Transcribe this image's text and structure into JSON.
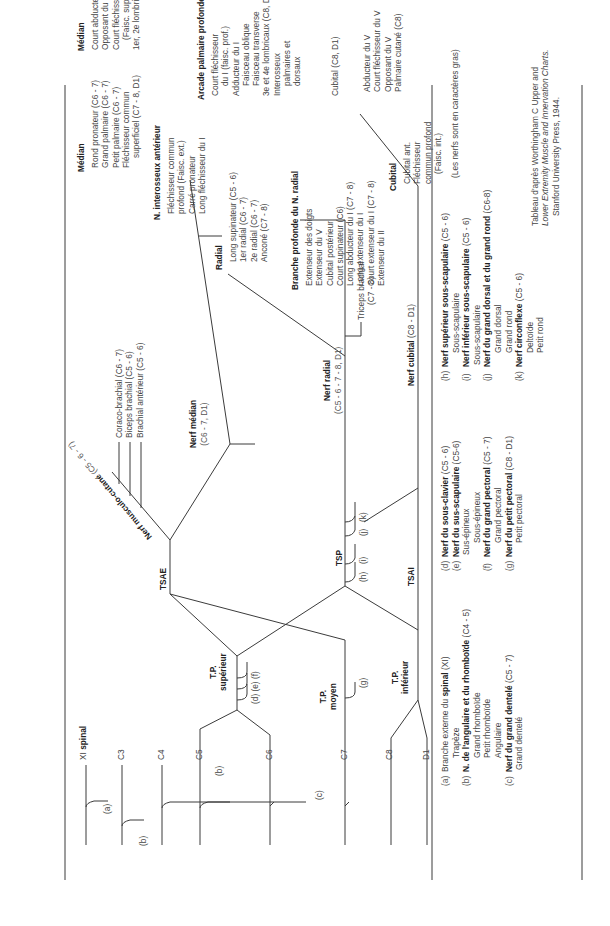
{
  "title": [
    "NERF CRANIEN ET",
    "BRANCHES ANTÉRIEURES DES",
    "NERFS RACHIDIENS"
  ],
  "columns": {
    "racines": "Racines",
    "troncs_primaires": "Troncs primaires",
    "troncs_secondaires": "Troncs secondaires",
    "branches_terminales": "Branches terminales",
    "bras": "Bras",
    "avant_bras": "Avant-bras",
    "main": "Main"
  },
  "roots": {
    "xi": "XI",
    "xi_name": "spinal",
    "c3": "C3",
    "c4": "C4",
    "c5": "C5",
    "c6": "C6",
    "c7": "C7",
    "c8": "C8",
    "d1": "D1"
  },
  "root_labels": {
    "a": "(a)",
    "b1": "(b)",
    "b2": "(b)",
    "c": "(c)"
  },
  "trunks": {
    "sup_1": "T.P.",
    "sup_2": "supérieur",
    "moy_1": "T.P.",
    "moy_2": "moyen",
    "inf_1": "T.P.",
    "inf_2": "inférieur",
    "sup_labels": "(d)  (e)  (f)",
    "moy_label": "(g)"
  },
  "secondary": {
    "tsae": "TSAE",
    "tsp": "TSP",
    "tsai": "TSAI",
    "tsp_labels": {
      "h": "(h)",
      "i": "(i)",
      "j": "(j)",
      "k": "(k)"
    }
  },
  "terminal": {
    "musculo": "Nerf musculo-cutané",
    "musculo_roots": "(C5 - 6 - 7)",
    "median": "Nerf médian",
    "median_roots": "(C6 - 7, D1)",
    "radial": "Nerf radial",
    "radial_roots": "(C5 - 6 - 7 - 8, D1)",
    "cubital": "Nerf cubital",
    "cubital_roots": "(C8 - D1)"
  },
  "bras": {
    "musculo_branches": [
      "Coraco-brachial (C6 - 7)",
      "Biceps brachial (C5 - 6)",
      "Brachial antérieur (C5 - 6)"
    ],
    "triceps": [
      "Triceps brachial",
      "(C7 - 8)"
    ]
  },
  "avant_bras": {
    "median_title": "Médian",
    "median_items": [
      "Rond pronateur (C6 - 7)",
      "Grand palmaire (C6 - 7)",
      "Petit palmaire (C6 - 7)",
      "Fléchisseur commun",
      "superficiel (C7 - 8, D1)"
    ],
    "interosseux_title": "N. interosseux antérieur",
    "interosseux_items": [
      "Fléchisseur commun",
      "profond (Faisc. ext.)",
      "Carré pronateur",
      "Long fléchisseur du I"
    ],
    "radial_title": "Radial",
    "radial_items": [
      "Long supinateur (C5 - 6)",
      "1er radial (C6 - 7)",
      "2e radial (C6 - 7)",
      "Anconé (C7 - 8)"
    ],
    "branche_title": "Branche profonde du N. radial",
    "branche_items": [
      "Extenseur des doigts",
      "Extenseur du V",
      "Cubital postérieur",
      "Court supinateur (C6)",
      "Long abducteur du I (C7 - 8)",
      "Long extenseur du I",
      "Court extenseur du I (C7 - 8)",
      "Extenseur du II"
    ],
    "cubital_title": "Cubital",
    "cubital_items": [
      "Cubital ant.",
      "Fléchisseur",
      "commun profond",
      "(Faisc. int.)"
    ]
  },
  "main": {
    "median_title": "Médian",
    "median_items": [
      "Court abducteur du I",
      "Opposant du I",
      "Court fléchisseur du I",
      "(Faisc. superf.)",
      "1er, 2e lombricaux"
    ],
    "arcade_title": "Arcade palmaire profonde",
    "arcade_items": [
      "Court fléchisseur",
      "du I (faisc. prof.)",
      "Adducteur du I",
      "Faisceau oblique",
      "Faisceau transverse",
      "3e et 4e lombricaux (C8, D1)",
      "Interosseux",
      "palmaires et",
      "dorsaux"
    ],
    "cubital_label": "Cubital (C8, D1)",
    "cubital_items": [
      "Abducteur du V",
      "Court fléchisseur du V",
      "Opposant du V",
      "Palmaire cutané (C8)"
    ]
  },
  "legend": {
    "col1": [
      {
        "key": "(a)",
        "pre": "Branche externe du ",
        "bold": "spinal",
        "post": " (XI)"
      },
      {
        "sub": "Trapèze"
      },
      {
        "key": "(b)",
        "bold": "N. de l'angulaire et du rhomboïde",
        "post": " (C4 - 5)"
      },
      {
        "sub": "Grand rhomboïde"
      },
      {
        "sub": "Petit rhomboïde"
      },
      {
        "sub": "Angulaire"
      },
      {
        "key": "(c)",
        "bold": "Nerf du grand dentelé",
        "post": " (C5 - 7)"
      },
      {
        "sub": "Grand dentelé"
      }
    ],
    "col2": [
      {
        "key": "(d)",
        "bold": "Nerf du sous-clavier",
        "post": " (C5 - 6)"
      },
      {
        "key": "(e)",
        "bold": "Nerf du sus-scapulaire",
        "post": " (C5-6)"
      },
      {
        "sub": "Sus-épineux"
      },
      {
        "sub": "Sous-épineux"
      },
      {
        "key": "(f)",
        "bold": "Nerf du grand pectoral",
        "post": " (C5 - 7)"
      },
      {
        "sub": "Grand pectoral"
      },
      {
        "key": "(g)",
        "bold": "Nerf du petit pectoral",
        "post": " (C8 - D1)"
      },
      {
        "sub": "Petit pectoral"
      }
    ],
    "col3": [
      {
        "key": "(h)",
        "bold": "Nerf supérieur sous-scapulaire",
        "post": " (C5 - 6)"
      },
      {
        "sub": "Sous-scapulaire"
      },
      {
        "key": "(i)",
        "bold": "Nerf inférieur sous-scapulaire",
        "post": " (C5 - 6)"
      },
      {
        "sub": "Sous-scapulaire"
      },
      {
        "key": "(j)",
        "bold": "Nerf du grand dorsal et du grand rond",
        "post": " (C6-8)"
      },
      {
        "sub": "Grand dorsal"
      },
      {
        "sub": "Grand rond"
      },
      {
        "key": "(k)",
        "bold": "Nerf circonflexe",
        "post": " (C5 - 6)"
      },
      {
        "sub": "Deltoïde"
      },
      {
        "sub": "Petit rond"
      }
    ],
    "note": "(Les nerfs sont en caractères gras)",
    "source": [
      "Tableau d'après Worthingham C Upper and",
      "Lower Extremity Muscle and Innervation Charts.",
      "Stanford University Press, 1944."
    ]
  }
}
